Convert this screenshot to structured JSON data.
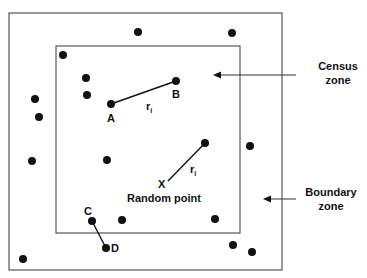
{
  "diagram": {
    "outer_box": {
      "x": 9,
      "y": 13,
      "w": 273,
      "h": 257
    },
    "inner_box": {
      "x": 56,
      "y": 46,
      "w": 184,
      "h": 187
    },
    "colors": {
      "line": "#555555",
      "dot": "#111111",
      "text": "#111111"
    },
    "labels": {
      "A": "A",
      "B": "B",
      "C": "C",
      "D": "D",
      "X": "X",
      "random_point": "Random point",
      "ri_1": "r",
      "ri_2": "r",
      "ri_sub": "i",
      "census_line1": "Census",
      "census_line2": "zone",
      "boundary_line1": "Boundary",
      "boundary_line2": "zone"
    },
    "points": [
      {
        "x": 138,
        "y": 32
      },
      {
        "x": 232,
        "y": 33
      },
      {
        "x": 63,
        "y": 55
      },
      {
        "x": 86,
        "y": 78
      },
      {
        "x": 87,
        "y": 95
      },
      {
        "x": 111,
        "y": 104,
        "label": "A"
      },
      {
        "x": 176,
        "y": 81,
        "label": "B"
      },
      {
        "x": 35,
        "y": 99
      },
      {
        "x": 39,
        "y": 117
      },
      {
        "x": 32,
        "y": 161
      },
      {
        "x": 107,
        "y": 160
      },
      {
        "x": 205,
        "y": 143
      },
      {
        "x": 250,
        "y": 146
      },
      {
        "x": 92,
        "y": 221,
        "label": "C"
      },
      {
        "x": 122,
        "y": 220
      },
      {
        "x": 215,
        "y": 219
      },
      {
        "x": 106,
        "y": 248,
        "label": "D"
      },
      {
        "x": 23,
        "y": 259
      },
      {
        "x": 233,
        "y": 245
      },
      {
        "x": 252,
        "y": 252
      }
    ]
  }
}
